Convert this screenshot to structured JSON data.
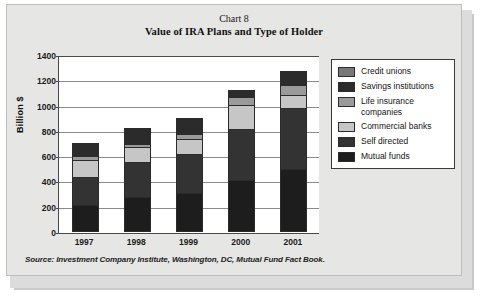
{
  "chart_data": {
    "type": "bar",
    "subtype": "stacked",
    "title": "Value of IRA Plans and Type of Holder",
    "chart_number": "Chart 8",
    "xlabel": "",
    "ylabel": "Billion $",
    "categories": [
      "1997",
      "1998",
      "1999",
      "2000",
      "2001"
    ],
    "ylim": [
      0,
      1400
    ],
    "yticks": [
      1400,
      1200,
      1000,
      800,
      600,
      400,
      200,
      0
    ],
    "grid": true,
    "legend_position": "right",
    "legend_order": [
      "Credit unions",
      "Savings institutions",
      "Life insurance\ncompanies",
      "Commercial banks",
      "Self directed",
      "Mutual funds"
    ],
    "series": [
      {
        "name": "Mutual funds",
        "color": "#1d1d1d",
        "values": [
          215,
          278,
          305,
          410,
          500
        ]
      },
      {
        "name": "Self directed",
        "color": "#333333",
        "values": [
          228,
          282,
          320,
          415,
          490
        ]
      },
      {
        "name": "Commercial banks",
        "color": "#c6c6c6",
        "values": [
          140,
          125,
          130,
          195,
          110
        ]
      },
      {
        "name": "Life insurance companies",
        "color": "#9a9a9a",
        "values": [
          45,
          35,
          45,
          70,
          90
        ]
      },
      {
        "name": "Savings institutions",
        "color": "#2b2b2b",
        "values": [
          100,
          130,
          125,
          55,
          105
        ]
      },
      {
        "name": "Credit unions",
        "color": "#787878",
        "values": [
          17,
          15,
          15,
          20,
          15
        ]
      }
    ],
    "totals": [
      745,
      865,
      940,
      1165,
      1310
    ],
    "source": "Source: Investment Company Institute, Washington, DC, Mutual Fund Fact Book."
  }
}
